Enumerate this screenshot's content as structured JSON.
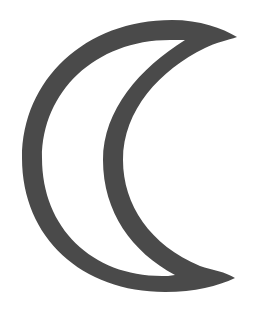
{
  "figure": {
    "description": "Outlined crescent moon symbol",
    "colors": {
      "background": "#ffffff",
      "stroke_fill": "#4a4a4a"
    }
  }
}
